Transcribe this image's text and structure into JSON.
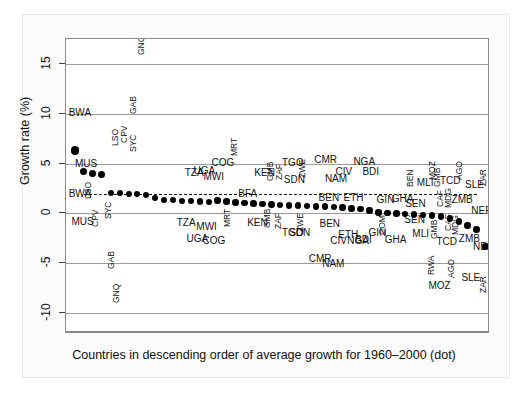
{
  "figure": {
    "background": "#ffffff",
    "paper_background": "#fbfbfb",
    "accent": "#000000",
    "width": 528,
    "height": 396
  },
  "chart_data": {
    "type": "scatter",
    "title": "",
    "xlabel": "Countries in descending order of average growth for 1960–2000 (dot)",
    "ylabel": "Growth rate (%)",
    "ylim": [
      -12,
      17.5
    ],
    "yticks": [
      15,
      10,
      5,
      0,
      -5,
      -10
    ],
    "ytick_labels": [
      "15",
      "10",
      "5",
      "0",
      "-5",
      "-10"
    ],
    "gridlines": [
      15,
      10,
      5,
      0,
      -5,
      -10
    ],
    "grid": true,
    "legend": "",
    "reference_line": {
      "style": "dashed",
      "value": 2.0,
      "x_start": 2,
      "x_end": 46
    },
    "series": [
      {
        "name": "Average growth 1960-2000 (dot)",
        "marker": "dot",
        "x": [
          1,
          2,
          3,
          4,
          5,
          6,
          7,
          8,
          9,
          10,
          11,
          12,
          13,
          14,
          15,
          16,
          17,
          18,
          19,
          20,
          21,
          22,
          23,
          24,
          25,
          26,
          27,
          28,
          29,
          30,
          31,
          32,
          33,
          34,
          35,
          36,
          37,
          38,
          39,
          40,
          41,
          42,
          43,
          44,
          45,
          46,
          47
        ],
        "values": [
          6.3,
          4.2,
          4.0,
          3.9,
          2.1,
          2.1,
          2.0,
          2.0,
          1.9,
          1.6,
          1.4,
          1.35,
          1.3,
          1.25,
          1.2,
          1.15,
          1.3,
          1.2,
          1.1,
          1.05,
          1.0,
          0.95,
          0.9,
          0.85,
          0.8,
          0.78,
          0.75,
          0.7,
          0.68,
          0.65,
          0.6,
          0.5,
          0.45,
          0.3,
          0.1,
          0.05,
          0.0,
          -0.05,
          -0.1,
          -0.15,
          -0.2,
          -0.3,
          -0.5,
          -0.8,
          -1.2,
          -1.6,
          -3.3
        ]
      }
    ],
    "country_labels_above": [
      {
        "code": "GNQ",
        "x": 7.9,
        "y": 15.9,
        "rot": true
      },
      {
        "code": "BWA",
        "x": 0.3,
        "y": 10.1,
        "rot": false
      },
      {
        "code": "GAB",
        "x": 7.0,
        "y": 10.0,
        "rot": true
      },
      {
        "code": "LSO",
        "x": 5.0,
        "y": 6.8,
        "rot": true
      },
      {
        "code": "CPV",
        "x": 6.0,
        "y": 7.1,
        "rot": true
      },
      {
        "code": "SYC",
        "x": 7.0,
        "y": 6.2,
        "rot": true
      },
      {
        "code": "MUS",
        "x": 1.0,
        "y": 5.0,
        "rot": false
      },
      {
        "code": "COG",
        "x": 16.3,
        "y": 5.1,
        "rot": false
      },
      {
        "code": "MRT",
        "x": 18.4,
        "y": 5.8,
        "rot": true
      },
      {
        "code": "TGO",
        "x": 24.2,
        "y": 5.1,
        "rot": false
      },
      {
        "code": "CMR",
        "x": 27.8,
        "y": 5.4,
        "rot": false
      },
      {
        "code": "NGA",
        "x": 32.2,
        "y": 5.2,
        "rot": false
      },
      {
        "code": "TZA",
        "x": 13.3,
        "y": 4.1,
        "rot": false
      },
      {
        "code": "UGA",
        "x": 14.3,
        "y": 4.3,
        "rot": false
      },
      {
        "code": "MWI",
        "x": 15.4,
        "y": 3.7,
        "rot": false
      },
      {
        "code": "KEN",
        "x": 21.1,
        "y": 4.1,
        "rot": false
      },
      {
        "code": "GMB",
        "x": 22.4,
        "y": 3.3,
        "rot": true
      },
      {
        "code": "ZAF",
        "x": 23.4,
        "y": 3.4,
        "rot": true
      },
      {
        "code": "SDN",
        "x": 24.4,
        "y": 3.4,
        "rot": false
      },
      {
        "code": "ZWE",
        "x": 26.0,
        "y": 3.6,
        "rot": true
      },
      {
        "code": "CIV",
        "x": 30.2,
        "y": 4.2,
        "rot": false
      },
      {
        "code": "NAM",
        "x": 29.0,
        "y": 3.5,
        "rot": false
      },
      {
        "code": "BDI",
        "x": 33.2,
        "y": 4.2,
        "rot": false
      },
      {
        "code": "MLI",
        "x": 39.3,
        "y": 3.1,
        "rot": false
      },
      {
        "code": "BEN",
        "x": 38.1,
        "y": 2.7,
        "rot": true
      },
      {
        "code": "MOZ",
        "x": 40.6,
        "y": 3.4,
        "rot": true
      },
      {
        "code": "GMB",
        "x": 41.1,
        "y": 2.7,
        "rot": true
      },
      {
        "code": "TCD",
        "x": 41.9,
        "y": 3.3,
        "rot": false
      },
      {
        "code": "AGO",
        "x": 43.6,
        "y": 3.4,
        "rot": true
      },
      {
        "code": "SLE",
        "x": 44.7,
        "y": 2.9,
        "rot": false
      },
      {
        "code": "ZAR",
        "x": 46.3,
        "y": 2.8,
        "rot": true
      },
      {
        "code": "BWA",
        "x": 0.3,
        "y": 2.0,
        "rot": false
      },
      {
        "code": "LSO",
        "x": 2.0,
        "y": 1.5,
        "rot": true
      },
      {
        "code": "BFA",
        "x": 19.3,
        "y": 2.0,
        "rot": false
      },
      {
        "code": "BEN",
        "x": 28.3,
        "y": 1.6,
        "rot": false
      },
      {
        "code": "ETH",
        "x": 31.1,
        "y": 1.6,
        "rot": false
      },
      {
        "code": "GIN",
        "x": 34.8,
        "y": 1.4,
        "rot": false
      },
      {
        "code": "GHA",
        "x": 36.5,
        "y": 1.5,
        "rot": false
      },
      {
        "code": "SEN",
        "x": 38.0,
        "y": 0.9,
        "rot": false
      },
      {
        "code": "CAF",
        "x": 41.4,
        "y": 0.6,
        "rot": true
      },
      {
        "code": "MDG",
        "x": 42.3,
        "y": 0.5,
        "rot": true
      },
      {
        "code": "ZMB",
        "x": 43.2,
        "y": 1.4,
        "rot": false
      },
      {
        "code": "NER",
        "x": 45.4,
        "y": 0.2,
        "rot": false
      }
    ],
    "country_labels_below": [
      {
        "code": "MUS",
        "x": 0.6,
        "y": -0.9,
        "rot": false
      },
      {
        "code": "CPV",
        "x": 2.8,
        "y": -1.4,
        "rot": true
      },
      {
        "code": "SYC",
        "x": 4.2,
        "y": -0.6,
        "rot": true
      },
      {
        "code": "TZA",
        "x": 12.4,
        "y": -1.0,
        "rot": false
      },
      {
        "code": "MWI",
        "x": 14.6,
        "y": -1.4,
        "rot": false
      },
      {
        "code": "MRT",
        "x": 17.6,
        "y": -1.4,
        "rot": true
      },
      {
        "code": "KEN",
        "x": 20.3,
        "y": -1.0,
        "rot": false
      },
      {
        "code": "GMB",
        "x": 22.1,
        "y": -1.5,
        "rot": true
      },
      {
        "code": "ZAF",
        "x": 23.3,
        "y": -1.6,
        "rot": true
      },
      {
        "code": "TGO",
        "x": 24.2,
        "y": -2.0,
        "rot": false
      },
      {
        "code": "SDN",
        "x": 25.0,
        "y": -2.0,
        "rot": false
      },
      {
        "code": "ZWE",
        "x": 25.8,
        "y": -1.9,
        "rot": true
      },
      {
        "code": "UGA",
        "x": 13.5,
        "y": -2.6,
        "rot": false
      },
      {
        "code": "COG",
        "x": 15.3,
        "y": -2.8,
        "rot": false
      },
      {
        "code": "BEN",
        "x": 28.4,
        "y": -1.1,
        "rot": false
      },
      {
        "code": "SEN",
        "x": 37.9,
        "y": -0.7,
        "rot": false
      },
      {
        "code": "ETH",
        "x": 30.5,
        "y": -2.2,
        "rot": false
      },
      {
        "code": "CIV",
        "x": 29.6,
        "y": -2.8,
        "rot": false
      },
      {
        "code": "NGA",
        "x": 31.5,
        "y": -2.8,
        "rot": false
      },
      {
        "code": "BDI",
        "x": 32.4,
        "y": -2.7,
        "rot": false
      },
      {
        "code": "GIN",
        "x": 33.9,
        "y": -2.0,
        "rot": false
      },
      {
        "code": "COM",
        "x": 35.0,
        "y": -2.2,
        "rot": true
      },
      {
        "code": "GHA",
        "x": 35.7,
        "y": -2.7,
        "rot": false
      },
      {
        "code": "MLI",
        "x": 38.8,
        "y": -2.1,
        "rot": false
      },
      {
        "code": "GMB",
        "x": 40.8,
        "y": -2.6,
        "rot": true
      },
      {
        "code": "TCD",
        "x": 41.5,
        "y": -2.9,
        "rot": false
      },
      {
        "code": "CAF",
        "x": 42.3,
        "y": -1.8,
        "rot": true
      },
      {
        "code": "MDG",
        "x": 43.1,
        "y": -2.2,
        "rot": true
      },
      {
        "code": "ZMB",
        "x": 44.0,
        "y": -2.6,
        "rot": false
      },
      {
        "code": "NER",
        "x": 45.6,
        "y": -3.4,
        "rot": false
      },
      {
        "code": "GAB",
        "x": 4.6,
        "y": -5.6,
        "rot": true
      },
      {
        "code": "CMR",
        "x": 27.2,
        "y": -4.6,
        "rot": false
      },
      {
        "code": "NAM",
        "x": 28.7,
        "y": -5.1,
        "rot": false
      },
      {
        "code": "RWA",
        "x": 40.4,
        "y": -6.2,
        "rot": true
      },
      {
        "code": "MOZ",
        "x": 40.6,
        "y": -7.3,
        "rot": false
      },
      {
        "code": "AGO",
        "x": 42.7,
        "y": -6.5,
        "rot": true
      },
      {
        "code": "SLE",
        "x": 44.3,
        "y": -6.5,
        "rot": false
      },
      {
        "code": "ZAR",
        "x": 46.3,
        "y": -8.0,
        "rot": true
      },
      {
        "code": "GNQ",
        "x": 5.1,
        "y": -9.0,
        "rot": true
      }
    ]
  }
}
